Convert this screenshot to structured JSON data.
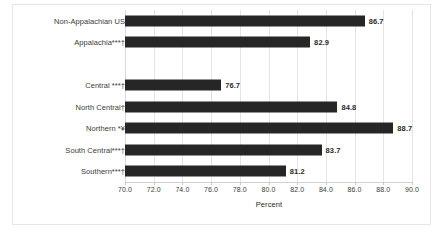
{
  "chart_data": {
    "type": "bar",
    "orientation": "horizontal",
    "title": "",
    "subtitle": "",
    "xlabel": "Percent",
    "ylabel": "",
    "xlim": [
      70.0,
      90.0
    ],
    "xticks": [
      "70.0",
      "72.0",
      "74.0",
      "76.0",
      "78.0",
      "80.0",
      "82.0",
      "84.0",
      "86.0",
      "88.0",
      "90.0"
    ],
    "xtick_step": 2.0,
    "grid": true,
    "legend": false,
    "legend_position": "none",
    "bar_color": "#262626",
    "gridline_color": "#e4e4e4",
    "background_color": "#ffffff",
    "categories": [
      "Non-Appalachian US",
      "Appalachia***†",
      "",
      "Central ***†",
      "North Central†",
      "Northern *¥",
      "South Central***†",
      "Southern***†"
    ],
    "values": [
      86.7,
      82.9,
      null,
      76.7,
      84.8,
      88.7,
      83.7,
      81.2
    ],
    "data_labels": [
      "86.7",
      "82.9",
      "",
      "76.7",
      "84.8",
      "88.7",
      "83.7",
      "81.2"
    ]
  }
}
